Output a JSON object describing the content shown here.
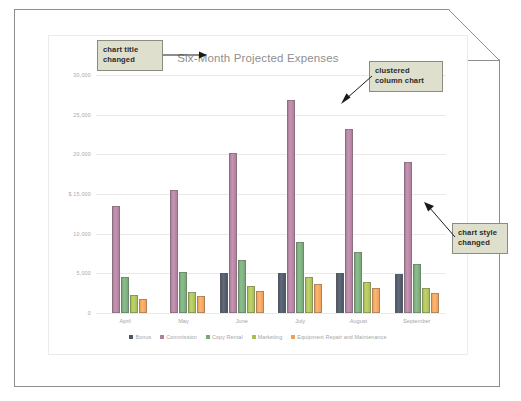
{
  "document": {
    "name": "chart-worksheet-page"
  },
  "callouts": [
    {
      "id": "chart-title-changed",
      "text": "chart title changed"
    },
    {
      "id": "clustered-column-chart",
      "text": "clustered column chart"
    },
    {
      "id": "chart-style-changed",
      "text": "chart style changed"
    }
  ],
  "chart_data": {
    "type": "bar",
    "title": "Six-Month Projected Expenses",
    "xlabel": "",
    "ylabel": "",
    "ylim": [
      0,
      30000
    ],
    "yticks": [
      0,
      5000,
      10000,
      15000,
      20000,
      25000,
      30000
    ],
    "ytick_labels": [
      "0",
      "5,000",
      "10,000",
      "$ 15,000",
      "20,000",
      "25,000",
      "30,000"
    ],
    "currency_symbol": "$",
    "grid": true,
    "legend_position": "bottom",
    "categories": [
      "April",
      "May",
      "June",
      "July",
      "August",
      "September"
    ],
    "series": [
      {
        "name": "Bonus",
        "color": "#4c5566",
        "values": [
          0,
          0,
          5000,
          5000,
          5000,
          4950
        ]
      },
      {
        "name": "Commission",
        "color": "#b07f9d",
        "values": [
          13500,
          15500,
          20200,
          26900,
          23200,
          19000
        ]
      },
      {
        "name": "Copy Rental",
        "color": "#77a878",
        "values": [
          4600,
          5200,
          6700,
          9000,
          7700,
          6200
        ]
      },
      {
        "name": "Marketing",
        "color": "#a9bf55",
        "values": [
          2300,
          2600,
          3400,
          4500,
          3900,
          3200
        ]
      },
      {
        "name": "Equipment Repair and Maintenance",
        "color": "#eda05a",
        "values": [
          1800,
          2200,
          2800,
          3600,
          3100,
          2500
        ]
      }
    ]
  },
  "colors": {
    "callout_fill": "#dedfcd",
    "callout_border": "#8c8c7e",
    "gridline": "#e9e9e9",
    "axis_text": "#a5a5a5",
    "title_text": "#8f8f8f"
  }
}
